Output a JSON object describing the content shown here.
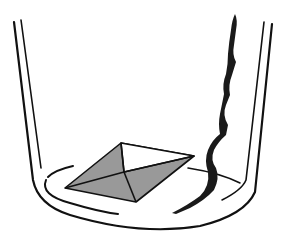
{
  "figure": {
    "colors": {
      "background": "#ffffff",
      "line": "#111111",
      "crystal_fill": "#999999",
      "crystal_top_face": "#ffffff",
      "trail": "#1a1a1a"
    },
    "elements": [
      {
        "name": "beaker",
        "label": ""
      },
      {
        "name": "crystal",
        "label": ""
      },
      {
        "name": "dissolution-trail",
        "label": ""
      }
    ]
  }
}
